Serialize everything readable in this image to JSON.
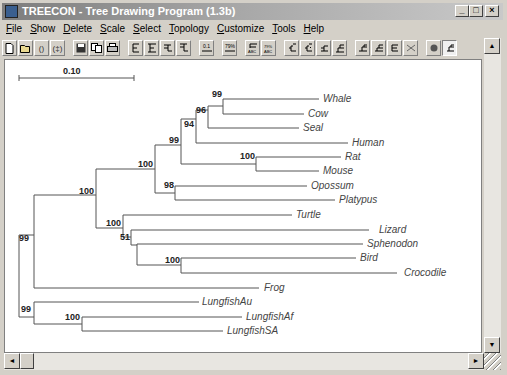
{
  "window": {
    "title": "TREECON - Tree Drawing Program (1.3b)",
    "controls": {
      "minimize": "_",
      "maximize": "□",
      "close": "×"
    }
  },
  "menu": {
    "items": [
      {
        "label": "File",
        "accel": "F"
      },
      {
        "label": "Show",
        "accel": "S"
      },
      {
        "label": "Delete",
        "accel": "D"
      },
      {
        "label": "Scale",
        "accel": "S"
      },
      {
        "label": "Select",
        "accel": "S"
      },
      {
        "label": "Topology",
        "accel": "T"
      },
      {
        "label": "Customize",
        "accel": "C"
      },
      {
        "label": "Tools",
        "accel": "T"
      },
      {
        "label": "Help",
        "accel": "H"
      }
    ]
  },
  "toolbar": {
    "icons": [
      "new-file-icon",
      "open-file-icon",
      "bracket-icon",
      "bracket-alt-icon",
      "save-icon",
      "copy-icon",
      "print-icon",
      "tree-left-icon",
      "tree-left-alt-icon",
      "tree-right-icon",
      "tree-right-alt-icon",
      "scale-bar-icon",
      "scale-value-icon",
      "label-abc-icon",
      "label-abc-alt-icon",
      "rotate-left-icon",
      "rotate-right-icon",
      "flip-node-icon",
      "ladderize-icon",
      "branch-a-icon",
      "branch-b-icon",
      "branch-c-icon",
      "cross-icon",
      "color-icon",
      "font-icon"
    ]
  },
  "tree": {
    "scale_bar": {
      "label": "0.10"
    },
    "taxa": [
      "Whale",
      "Cow",
      "Seal",
      "Human",
      "Rat",
      "Mouse",
      "Opossum",
      "Platypus",
      "Turtle",
      "Lizard",
      "Sphenodon",
      "Bird",
      "Crocodile",
      "Frog",
      "LungfishAu",
      "LungfishAf",
      "LungfishSA"
    ],
    "bootstrap": {
      "whale_cow": "99",
      "whale_cow_seal": "96",
      "ruminant_seal_human": "94",
      "placentals": "99",
      "rat_mouse": "100",
      "mammals": "100",
      "opossum_platypus": "98",
      "amniotes": "100",
      "reptiles": "100",
      "lizard_group": "51",
      "bird_croc": "100",
      "tetrapods": "100",
      "root": "99",
      "lungfish": "99",
      "lungfishAf_SA": "100"
    }
  },
  "scrollbars": {
    "up": "▲",
    "down": "▼",
    "left": "◄",
    "right": "►"
  }
}
